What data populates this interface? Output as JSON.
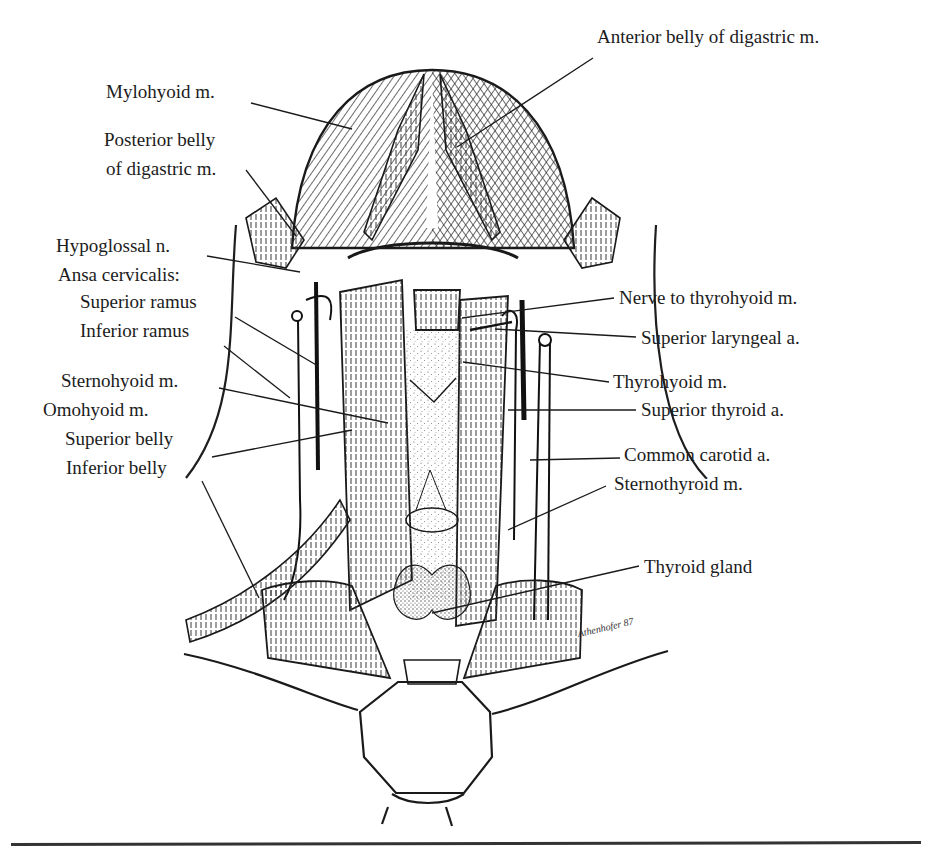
{
  "figure": {
    "type": "anatomical-illustration",
    "signature": "Athenhofer 87",
    "labels_left": [
      {
        "id": "mylohyoid",
        "text": "Mylohyoid m.",
        "x": 106,
        "y": 91
      },
      {
        "id": "posterior-belly-digastric-1",
        "text": "Posterior belly",
        "x": 104,
        "y": 139
      },
      {
        "id": "posterior-belly-digastric-2",
        "text": "of digastric m.",
        "x": 106,
        "y": 168
      },
      {
        "id": "hypoglossal",
        "text": "Hypoglossal n.",
        "x": 56,
        "y": 245
      },
      {
        "id": "ansa-cervicalis",
        "text": "Ansa cervicalis:",
        "x": 58,
        "y": 274
      },
      {
        "id": "superior-ramus",
        "text": "Superior ramus",
        "x": 80,
        "y": 301
      },
      {
        "id": "inferior-ramus",
        "text": "Inferior ramus",
        "x": 80,
        "y": 330
      },
      {
        "id": "sternohyoid",
        "text": "Sternohyoid m.",
        "x": 61,
        "y": 380
      },
      {
        "id": "omohyoid",
        "text": "Omohyoid m.",
        "x": 43,
        "y": 409
      },
      {
        "id": "superior-belly",
        "text": "Superior belly",
        "x": 65,
        "y": 438
      },
      {
        "id": "inferior-belly",
        "text": "Inferior belly",
        "x": 66,
        "y": 467
      }
    ],
    "labels_right": [
      {
        "id": "anterior-belly-digastric",
        "text": "Anterior belly of digastric m.",
        "x": 597,
        "y": 36
      },
      {
        "id": "nerve-to-thyrohyoid",
        "text": "Nerve to thyrohyoid m.",
        "x": 619,
        "y": 287
      },
      {
        "id": "superior-laryngeal",
        "text": "Superior laryngeal a.",
        "x": 641,
        "y": 327
      },
      {
        "id": "thyrohyoid",
        "text": "Thyrohyoid m.",
        "x": 613,
        "y": 371
      },
      {
        "id": "superior-thyroid",
        "text": "Superior thyroid a.",
        "x": 641,
        "y": 399
      },
      {
        "id": "common-carotid",
        "text": "Common carotid a.",
        "x": 624,
        "y": 444
      },
      {
        "id": "sternothyroid",
        "text": "Sternothyroid m.",
        "x": 614,
        "y": 473
      },
      {
        "id": "thyroid-gland",
        "text": "Thyroid gland",
        "x": 644,
        "y": 556
      }
    ],
    "leader_lines": [
      {
        "for": "mylohyoid",
        "x1": 251,
        "y1": 103,
        "x2": 352,
        "y2": 129
      },
      {
        "for": "anterior-belly-digastric",
        "x1": 593,
        "y1": 58,
        "x2": 457,
        "y2": 147
      },
      {
        "for": "posterior-belly-digastric",
        "x1": 246,
        "y1": 170,
        "x2": 296,
        "y2": 236
      },
      {
        "for": "hypoglossal",
        "x1": 207,
        "y1": 256,
        "x2": 300,
        "y2": 272
      },
      {
        "for": "superior-ramus",
        "x1": 235,
        "y1": 317,
        "x2": 318,
        "y2": 366
      },
      {
        "for": "inferior-ramus",
        "x1": 224,
        "y1": 346,
        "x2": 290,
        "y2": 398
      },
      {
        "for": "sternohyoid",
        "x1": 219,
        "y1": 388,
        "x2": 388,
        "y2": 423
      },
      {
        "for": "superior-belly",
        "x1": 212,
        "y1": 457,
        "x2": 352,
        "y2": 430
      },
      {
        "for": "inferior-belly",
        "x1": 202,
        "y1": 481,
        "x2": 259,
        "y2": 598
      },
      {
        "for": "nerve-to-thyrohyoid",
        "x1": 614,
        "y1": 298,
        "x2": 462,
        "y2": 318
      },
      {
        "for": "superior-laryngeal",
        "x1": 636,
        "y1": 337,
        "x2": 495,
        "y2": 329
      },
      {
        "for": "thyrohyoid",
        "x1": 609,
        "y1": 382,
        "x2": 463,
        "y2": 362
      },
      {
        "for": "superior-thyroid",
        "x1": 636,
        "y1": 410,
        "x2": 508,
        "y2": 410
      },
      {
        "for": "common-carotid",
        "x1": 620,
        "y1": 458,
        "x2": 530,
        "y2": 460
      },
      {
        "for": "sternothyroid",
        "x1": 606,
        "y1": 486,
        "x2": 508,
        "y2": 530
      },
      {
        "for": "thyroid-gland",
        "x1": 639,
        "y1": 566,
        "x2": 432,
        "y2": 613
      }
    ]
  },
  "page": {
    "caption_rule": true
  }
}
